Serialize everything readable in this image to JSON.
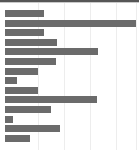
{
  "chart_data": {
    "type": "bar",
    "orientation": "horizontal",
    "title": "",
    "subtitle": "",
    "xlabel": "",
    "ylabel": "",
    "grid": true,
    "grid_axis": "x",
    "legend": null,
    "legend_position": "none",
    "axis_labels_visible": false,
    "tick_labels_visible": false,
    "categories": [
      "1",
      "2",
      "3",
      "4",
      "5",
      "6",
      "7",
      "8",
      "9",
      "10",
      "11",
      "12",
      "13",
      "14"
    ],
    "values": [
      30,
      100,
      30,
      40,
      71,
      39,
      25,
      9,
      25,
      70,
      35,
      6,
      42,
      19
    ],
    "xlim": [
      0,
      100
    ],
    "x_gridline_values": [
      25,
      45,
      65,
      85,
      100
    ],
    "bar_color": "#6b6b6b",
    "grid_color": "#ededed",
    "background_color": "#ffffff",
    "top_band_color": "#565656"
  },
  "chart": {
    "bar_color": "#6b6b6b",
    "grid_color": "#ededed",
    "background_color": "#ffffff"
  }
}
